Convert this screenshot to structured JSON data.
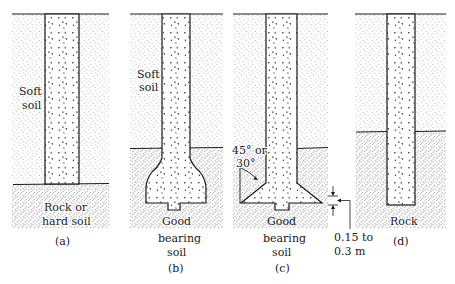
{
  "figure": {
    "panels": [
      {
        "id": "a",
        "caption": "(a)",
        "upper_layer": [
          "Soft",
          "soil"
        ],
        "lower_layer": [
          "Rock or",
          "hard soil"
        ],
        "type": "straight-shaft"
      },
      {
        "id": "b",
        "caption": "(b)",
        "upper_layer": [
          "Soft",
          "soil"
        ],
        "lower_layer": [
          "Good",
          "bearing",
          "soil"
        ],
        "type": "belled-dome"
      },
      {
        "id": "c",
        "caption": "(c)",
        "lower_layer": [
          "Good",
          "bearing",
          "soil"
        ],
        "angle_label": [
          "45° or",
          "30°"
        ],
        "dimension_label": [
          "0.15 to",
          "0.3 m"
        ],
        "type": "belled-angled"
      },
      {
        "id": "d",
        "caption": "(d)",
        "lower_layer": [
          "Rock"
        ],
        "type": "socketed-in-rock"
      }
    ],
    "colors": {
      "ink": "#1a1a1a",
      "soft_soil_stipple": "#6b6b6b",
      "hard_soil_stipple": "#3c3c3c",
      "background": "#ffffff"
    }
  }
}
